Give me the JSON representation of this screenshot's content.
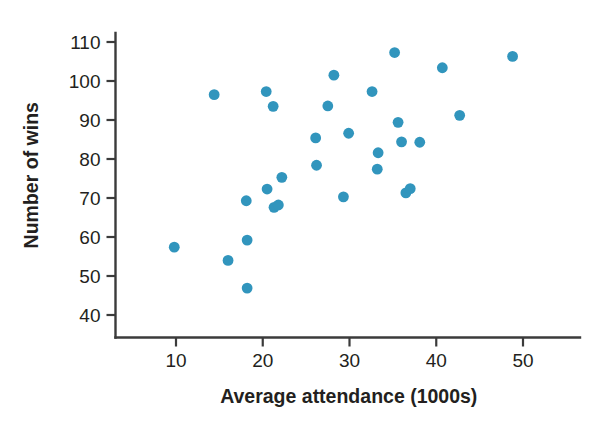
{
  "chart_data": {
    "type": "scatter",
    "title": "",
    "xlabel": "Average attendance (1000s)",
    "ylabel": "Number of wins",
    "xlim": [
      4.5,
      56
    ],
    "ylim": [
      36,
      114
    ],
    "xticks": [
      10,
      20,
      30,
      40,
      50
    ],
    "xtick_labels": [
      "10",
      "20",
      "30",
      "40",
      "50"
    ],
    "yticks": [
      40,
      50,
      60,
      70,
      80,
      90,
      100,
      110
    ],
    "ytick_labels": [
      "40",
      "50",
      "60",
      "70",
      "80",
      "90",
      "100",
      "110"
    ],
    "grid": false,
    "legend": null,
    "marker_color": "#3195bd",
    "marker_size": 9,
    "axis_color": "#3b3b3b",
    "text_color": "#231f20",
    "background": "#ffffff",
    "series": [
      {
        "name": "Teams",
        "points": [
          {
            "x": 9.8,
            "y": 57.4
          },
          {
            "x": 14.4,
            "y": 96.5
          },
          {
            "x": 16.0,
            "y": 54.0
          },
          {
            "x": 18.1,
            "y": 69.3
          },
          {
            "x": 18.2,
            "y": 59.2
          },
          {
            "x": 18.2,
            "y": 46.9
          },
          {
            "x": 20.4,
            "y": 97.3
          },
          {
            "x": 20.5,
            "y": 72.3
          },
          {
            "x": 21.2,
            "y": 93.5
          },
          {
            "x": 21.3,
            "y": 67.6
          },
          {
            "x": 21.8,
            "y": 68.2
          },
          {
            "x": 22.2,
            "y": 75.3
          },
          {
            "x": 26.1,
            "y": 85.4
          },
          {
            "x": 26.2,
            "y": 78.4
          },
          {
            "x": 27.5,
            "y": 93.6
          },
          {
            "x": 28.2,
            "y": 101.5
          },
          {
            "x": 29.3,
            "y": 70.3
          },
          {
            "x": 29.9,
            "y": 86.6
          },
          {
            "x": 32.6,
            "y": 97.3
          },
          {
            "x": 33.2,
            "y": 77.4
          },
          {
            "x": 33.3,
            "y": 81.6
          },
          {
            "x": 35.2,
            "y": 107.3
          },
          {
            "x": 35.6,
            "y": 89.4
          },
          {
            "x": 36.0,
            "y": 84.4
          },
          {
            "x": 36.5,
            "y": 71.3
          },
          {
            "x": 37.0,
            "y": 72.4
          },
          {
            "x": 38.1,
            "y": 84.3
          },
          {
            "x": 40.7,
            "y": 103.4
          },
          {
            "x": 42.7,
            "y": 91.2
          },
          {
            "x": 48.8,
            "y": 106.3
          }
        ]
      }
    ]
  }
}
